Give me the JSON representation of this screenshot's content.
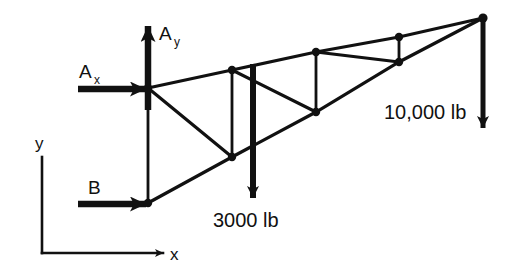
{
  "figure": {
    "ink_color": "#111111",
    "background": "#ffffff"
  },
  "reactions": {
    "ax_label": "A",
    "ax_subscript": "x",
    "ay_label": "A",
    "ay_subscript": "y",
    "b_label": "B"
  },
  "loads": [
    {
      "name": "load-3000",
      "label": "3000 lb",
      "magnitude": 3000,
      "units": "lb",
      "direction": "down"
    },
    {
      "name": "load-10000",
      "label": "10,000 lb",
      "magnitude": 10000,
      "units": "lb",
      "direction": "down"
    }
  ],
  "axes": {
    "x_label": "x",
    "y_label": "y"
  },
  "truss_data": {
    "type": "diagram",
    "joints": [
      {
        "id": "A",
        "x": 148,
        "y": 88,
        "chord": "top"
      },
      {
        "id": "T1",
        "x": 232,
        "y": 70,
        "chord": "top"
      },
      {
        "id": "T2",
        "x": 316,
        "y": 52,
        "chord": "top"
      },
      {
        "id": "T3",
        "x": 399,
        "y": 37,
        "chord": "top"
      },
      {
        "id": "T4",
        "x": 483,
        "y": 18,
        "chord": "top"
      },
      {
        "id": "B",
        "x": 148,
        "y": 203,
        "chord": "bottom"
      },
      {
        "id": "B1",
        "x": 232,
        "y": 157,
        "chord": "bottom"
      },
      {
        "id": "B2",
        "x": 316,
        "y": 112,
        "chord": "bottom"
      },
      {
        "id": "B3",
        "x": 399,
        "y": 62,
        "chord": "bottom"
      }
    ],
    "members": [
      [
        "A",
        "T1"
      ],
      [
        "T1",
        "T2"
      ],
      [
        "T2",
        "T3"
      ],
      [
        "T3",
        "T4"
      ],
      [
        "B",
        "B1"
      ],
      [
        "B1",
        "B2"
      ],
      [
        "B2",
        "B3"
      ],
      [
        "B3",
        "T4"
      ],
      [
        "A",
        "B"
      ],
      [
        "T1",
        "B1"
      ],
      [
        "T2",
        "B2"
      ],
      [
        "T3",
        "B3"
      ],
      [
        "A",
        "B1"
      ],
      [
        "T1",
        "B2"
      ],
      [
        "T2",
        "B3"
      ],
      [
        "T3",
        "T4"
      ]
    ]
  }
}
